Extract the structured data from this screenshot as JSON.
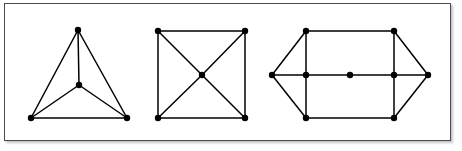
{
  "figure": {
    "caption": "",
    "background_color": "#ffffff",
    "frame": {
      "border_color": "#4a4a4a",
      "border_width": 1,
      "shadow_color": "#969696"
    },
    "style": {
      "edge_color": "#000000",
      "edge_width": 1.5,
      "vertex_color": "#000000",
      "vertex_radius": 3.2
    }
  },
  "diagram_data": {
    "type": "graph-diagram",
    "count": 3,
    "graphs": [
      {
        "name": "graph-1",
        "label": "",
        "description": "complete graph on four vertices drawn as a triangle with a central vertex",
        "vertex_count": 4,
        "edge_count": 6,
        "vertices": [
          {
            "id": "a1",
            "name": "apex",
            "x": 78,
            "y": 30
          },
          {
            "id": "a2",
            "name": "bottom-left",
            "x": 31,
            "y": 118
          },
          {
            "id": "a3",
            "name": "bottom-right",
            "x": 127,
            "y": 118
          },
          {
            "id": "a4",
            "name": "center",
            "x": 79,
            "y": 85
          }
        ],
        "edges": [
          {
            "from": "a1",
            "to": "a2"
          },
          {
            "from": "a1",
            "to": "a3"
          },
          {
            "from": "a2",
            "to": "a3"
          },
          {
            "from": "a1",
            "to": "a4"
          },
          {
            "from": "a2",
            "to": "a4"
          },
          {
            "from": "a3",
            "to": "a4"
          }
        ]
      },
      {
        "name": "graph-2",
        "label": "",
        "description": "square with both diagonals meeting at a central vertex",
        "vertex_count": 5,
        "edge_count": 8,
        "vertices": [
          {
            "id": "b1",
            "name": "top-left",
            "x": 158,
            "y": 31
          },
          {
            "id": "b2",
            "name": "top-right",
            "x": 245,
            "y": 31
          },
          {
            "id": "b3",
            "name": "bottom-right",
            "x": 245,
            "y": 118
          },
          {
            "id": "b4",
            "name": "bottom-left",
            "x": 158,
            "y": 118
          },
          {
            "id": "b5",
            "name": "center",
            "x": 202,
            "y": 75
          }
        ],
        "edges": [
          {
            "from": "b1",
            "to": "b2"
          },
          {
            "from": "b2",
            "to": "b3"
          },
          {
            "from": "b3",
            "to": "b4"
          },
          {
            "from": "b4",
            "to": "b1"
          },
          {
            "from": "b1",
            "to": "b5"
          },
          {
            "from": "b2",
            "to": "b5"
          },
          {
            "from": "b3",
            "to": "b5"
          },
          {
            "from": "b4",
            "to": "b5"
          }
        ]
      },
      {
        "name": "graph-3",
        "label": "",
        "description": "rectangle with left and right apex points, mid-side vertices and a central vertex on the horizontal axis",
        "vertex_count": 9,
        "edge_count": 12,
        "vertices": [
          {
            "id": "c1",
            "name": "left-apex",
            "x": 272,
            "y": 75
          },
          {
            "id": "c2",
            "name": "top-left",
            "x": 306,
            "y": 31
          },
          {
            "id": "c3",
            "name": "top-right",
            "x": 394,
            "y": 31
          },
          {
            "id": "c4",
            "name": "right-apex",
            "x": 428,
            "y": 75
          },
          {
            "id": "c5",
            "name": "bottom-right",
            "x": 394,
            "y": 118
          },
          {
            "id": "c6",
            "name": "bottom-left",
            "x": 306,
            "y": 118
          },
          {
            "id": "c7",
            "name": "mid-left",
            "x": 306,
            "y": 75
          },
          {
            "id": "c8",
            "name": "mid-right",
            "x": 394,
            "y": 75
          },
          {
            "id": "c9",
            "name": "center",
            "x": 350,
            "y": 75
          }
        ],
        "edges": [
          {
            "from": "c1",
            "to": "c2"
          },
          {
            "from": "c2",
            "to": "c3"
          },
          {
            "from": "c3",
            "to": "c4"
          },
          {
            "from": "c4",
            "to": "c5"
          },
          {
            "from": "c5",
            "to": "c6"
          },
          {
            "from": "c6",
            "to": "c1"
          },
          {
            "from": "c1",
            "to": "c7"
          },
          {
            "from": "c7",
            "to": "c9"
          },
          {
            "from": "c9",
            "to": "c8"
          },
          {
            "from": "c8",
            "to": "c4"
          },
          {
            "from": "c2",
            "to": "c7"
          },
          {
            "from": "c7",
            "to": "c6"
          },
          {
            "from": "c3",
            "to": "c8"
          },
          {
            "from": "c8",
            "to": "c5"
          }
        ]
      }
    ]
  }
}
